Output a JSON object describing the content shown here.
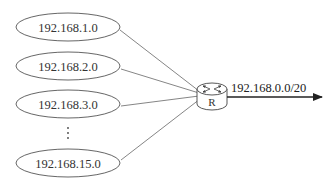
{
  "diagram": {
    "networks": [
      {
        "label": "192.168.1.0",
        "cx": 68,
        "cy": 27
      },
      {
        "label": "192.168.2.0",
        "cx": 68,
        "cy": 66
      },
      {
        "label": "192.168.3.0",
        "cx": 68,
        "cy": 104
      },
      {
        "label": "192.168.15.0",
        "cx": 68,
        "cy": 163
      }
    ],
    "ellipsis": "⋮",
    "router": {
      "label": "R",
      "cx": 212,
      "cy": 95
    },
    "aggregate_route": {
      "label": "192.168.0.0/20"
    },
    "colors": {
      "stroke": "#555555",
      "line": "#777777",
      "arrow": "#222222",
      "text": "#333333"
    }
  }
}
